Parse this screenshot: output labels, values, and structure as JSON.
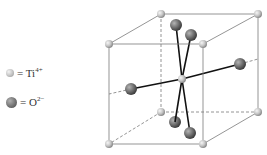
{
  "legend": {
    "items": [
      {
        "symbol": "ti-ion-sphere",
        "label": "= Ti",
        "charge": "4+"
      },
      {
        "symbol": "o-ion-sphere",
        "label": "= O",
        "charge": "2−"
      }
    ]
  },
  "colors": {
    "edge": "#7a7a7a",
    "bond": "#111111",
    "ti_light": "#f2f2f2",
    "ti_dark": "#9a9a9a",
    "o_light": "#a8a8a8",
    "o_dark": "#4a4a4a"
  }
}
